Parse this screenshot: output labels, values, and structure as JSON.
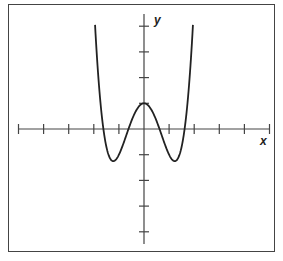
{
  "chart_data": {
    "type": "line",
    "title": "",
    "xlabel": "x",
    "ylabel": "y",
    "function": "y = x^4 - 3x^2 + 1",
    "xlim": [
      -5,
      5
    ],
    "ylim": [
      -4,
      4
    ],
    "x_ticks": [
      -5,
      -4,
      -3,
      -2,
      -1,
      1,
      2,
      3,
      4,
      5
    ],
    "y_ticks": [
      -4,
      -3,
      -2,
      -1,
      1,
      2,
      3,
      4
    ],
    "tick_labels_shown": false,
    "grid": false,
    "legend": null,
    "key_points": {
      "local_max": [
        0,
        1
      ],
      "local_min": [
        [
          -1.22,
          -1.25
        ],
        [
          1.22,
          -1.25
        ]
      ],
      "x_intercepts": [
        -1.618,
        -0.618,
        0.618,
        1.618
      ]
    },
    "series": [
      {
        "name": "f(x)",
        "x": [
          -1.95,
          -1.8,
          -1.6,
          -1.4,
          -1.22,
          -1.0,
          -0.8,
          -0.6,
          -0.4,
          -0.2,
          0,
          0.2,
          0.4,
          0.6,
          0.8,
          1.0,
          1.22,
          1.4,
          1.6,
          1.8,
          1.95
        ],
        "values": [
          4.05,
          1.78,
          -0.12,
          -1.04,
          -1.25,
          -1.0,
          -0.51,
          -0.01,
          0.54,
          0.88,
          1.0,
          0.88,
          0.54,
          -0.01,
          -0.51,
          -1.0,
          -1.25,
          -1.04,
          -0.12,
          1.78,
          4.05
        ]
      }
    ]
  },
  "labels": {
    "x_axis": "x",
    "y_axis": "y"
  },
  "colors": {
    "curve": "#222222",
    "axes": "#444444",
    "frame": "#444444"
  }
}
